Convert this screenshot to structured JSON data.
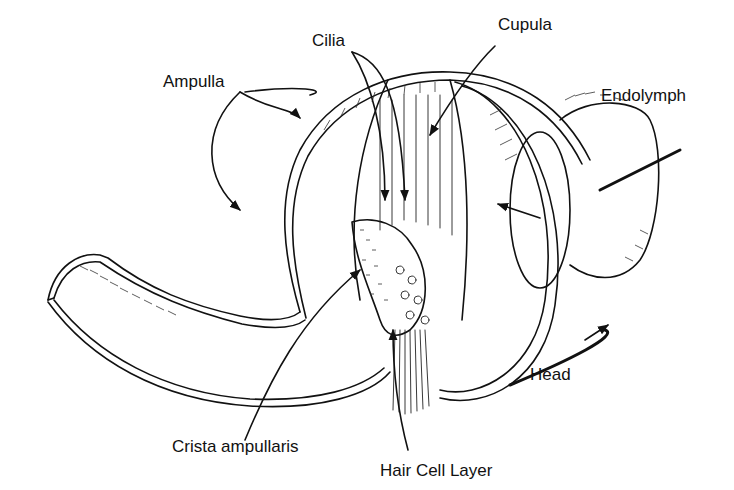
{
  "figure": {
    "labels": {
      "cilia": "Cilia",
      "cupula": "Cupula",
      "ampulla": "Ampulla",
      "endolymph": "Endolymph",
      "head": "Head",
      "crista_ampullaris": "Crista ampullaris",
      "hair_cell_layer": "Hair Cell Layer"
    },
    "colors": {
      "ink": "#111111",
      "background": "#ffffff"
    }
  }
}
